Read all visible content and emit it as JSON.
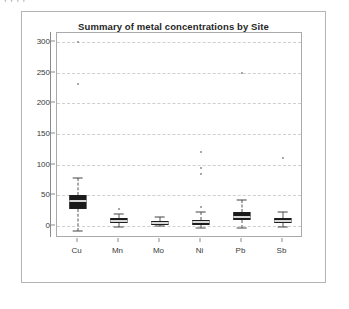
{
  "top_clip_text": "      ,            ,                  ,                ,",
  "frame": {
    "border_color": "#b4b4b4"
  },
  "chart_data": {
    "type": "box",
    "title": "Summary of metal concentrations by Site",
    "xlabel": "",
    "ylabel": "",
    "ylim": [
      -20,
      315
    ],
    "yticks": [
      0,
      50,
      100,
      150,
      200,
      250,
      300
    ],
    "ytick_labels": [
      "0",
      "50",
      "100",
      "150",
      "200",
      "250",
      "300"
    ],
    "grid": true,
    "grid_color": "#cfcfcf",
    "legend": "none",
    "categories": [
      "Cu",
      "Mn",
      "Mo",
      "Ni",
      "Pb",
      "Sb"
    ],
    "box_color": "#1a1a1a",
    "median_color": "#d8d8d8",
    "outlier_color": "#8d8d8d",
    "boxes": [
      {
        "category": "Cu",
        "whisker_low": -8,
        "q1": 28,
        "median": 40,
        "q3": 50,
        "whisker_high": 78,
        "outliers": [
          300,
          232
        ]
      },
      {
        "category": "Mn",
        "whisker_low": -2,
        "q1": 4,
        "median": 8,
        "q3": 12,
        "whisker_high": 20,
        "outliers": [
          28
        ]
      },
      {
        "category": "Mo",
        "whisker_low": -1,
        "q1": 2,
        "median": 5,
        "q3": 8,
        "whisker_high": 14,
        "outliers": []
      },
      {
        "category": "Ni",
        "whisker_low": -3,
        "q1": 2,
        "median": 6,
        "q3": 10,
        "whisker_high": 22,
        "outliers": [
          120,
          95,
          85,
          30
        ]
      },
      {
        "category": "Pb",
        "whisker_low": -4,
        "q1": 10,
        "median": 15,
        "q3": 22,
        "whisker_high": 42,
        "outliers": [
          250
        ]
      },
      {
        "category": "Sb",
        "whisker_low": -2,
        "q1": 4,
        "median": 8,
        "q3": 12,
        "whisker_high": 22,
        "outliers": [
          110
        ]
      }
    ]
  }
}
